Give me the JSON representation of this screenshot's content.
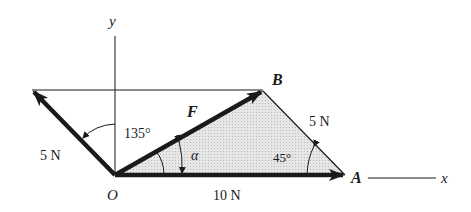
{
  "diagram": {
    "type": "vector force diagram (parallelogram/triangle rule)",
    "axes": {
      "x_label": "x",
      "y_label": "y"
    },
    "points": {
      "origin": "O",
      "a": "A",
      "b": "B"
    },
    "forces": [
      {
        "name": "force-10n",
        "magnitude_label": "10 N",
        "direction": "along +x from O to A"
      },
      {
        "name": "force-5n-left",
        "magnitude_label": "5 N",
        "direction": "135° from +x axis"
      },
      {
        "name": "force-5n-ab",
        "magnitude_label": "5 N",
        "direction": "from A to B"
      },
      {
        "name": "resultant",
        "label": "F",
        "direction": "from O to B"
      }
    ],
    "angles": {
      "angle_135": "135°",
      "angle_alpha": "α",
      "angle_45": "45°"
    },
    "colors": {
      "line": "#1a1a1a",
      "fill": "#d8d8d8",
      "background": "#ffffff"
    }
  }
}
